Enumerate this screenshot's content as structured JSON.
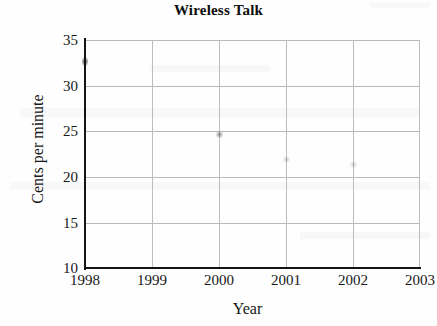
{
  "chart_data": {
    "type": "scatter",
    "title": "Wireless Talk",
    "xlabel": "Year",
    "ylabel": "Cents per minute",
    "x": [
      1998,
      2000,
      2001,
      2002
    ],
    "values": [
      32.6,
      24.6,
      21.9,
      21.4
    ],
    "series": [
      {
        "name": "Cents per minute",
        "points": [
          {
            "x": 1998,
            "y": 32.6
          },
          {
            "x": 2000,
            "y": 24.6
          },
          {
            "x": 2001,
            "y": 21.9
          },
          {
            "x": 2002,
            "y": 21.4
          }
        ]
      }
    ],
    "xlim": [
      1998,
      2003
    ],
    "ylim": [
      10,
      35
    ],
    "xticks": [
      1998,
      1999,
      2000,
      2001,
      2002,
      2003
    ],
    "yticks": [
      10,
      15,
      20,
      25,
      30,
      35
    ],
    "xtick_labels": [
      "1998",
      "1999",
      "2000",
      "2001",
      "2002",
      "2003"
    ],
    "ytick_labels": [
      "10",
      "15",
      "20",
      "25",
      "30",
      "35"
    ],
    "grid": true,
    "legend": null,
    "legend_position": "none",
    "colors": {
      "axis": "#141414",
      "grid": "#bbbbbb",
      "marker": "#3c3c3c",
      "background": "#fefefe",
      "text": "#181818"
    }
  }
}
